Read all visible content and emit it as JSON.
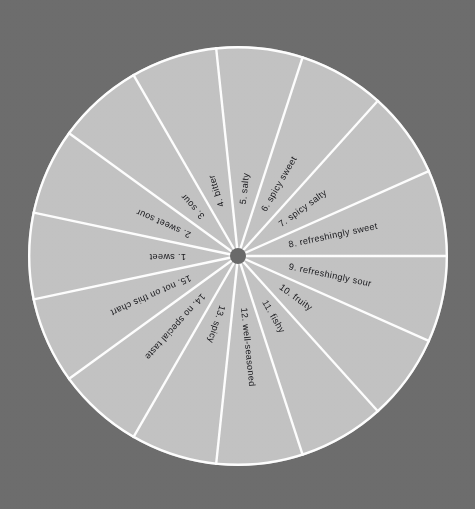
{
  "chart_data": {
    "type": "pie",
    "title": "",
    "subtitle": "",
    "xlabel": "",
    "ylabel": "",
    "legend_position": "none",
    "grid": false,
    "equal_slices": true,
    "slice_count": 15,
    "slice_angle_degrees": 24,
    "start_angle_degrees": 180,
    "direction": "counterclockwise",
    "categories": [
      "1. sweet",
      "2. sweet sour",
      "3. sour",
      "4. bitter",
      "5. salty",
      "6. spicy sweet",
      "7. spicy salty",
      "8. refreshingly sweet",
      "9. refreshingly sour",
      "10. fruity",
      "11. fishy",
      "12. well-seasoned",
      "13. spicy",
      "14. no special taste",
      "15. not on this chart"
    ],
    "values": [
      1,
      1,
      1,
      1,
      1,
      1,
      1,
      1,
      1,
      1,
      1,
      1,
      1,
      1,
      1
    ],
    "annotations": []
  },
  "colors": {
    "background": "#6d6d6d",
    "slice_fill": "#c2c2c2",
    "slice_divider": "#fdfdfd",
    "hub": "#6a6a6a",
    "label_text": "#17171b"
  },
  "wheel": {
    "center_x": 238,
    "center_y": 256,
    "radius": 210,
    "hub_radius": 8,
    "label_inner_radius": 52,
    "divider_width": 2.4
  },
  "slices": [
    {
      "index": 1,
      "label": "1. sweet",
      "mid_angle": 180
    },
    {
      "index": 2,
      "label": "2. sweet sour",
      "mid_angle": 156
    },
    {
      "index": 3,
      "label": "3. sour",
      "mid_angle": 132
    },
    {
      "index": 4,
      "label": "4. bitter",
      "mid_angle": 108
    },
    {
      "index": 5,
      "label": "5. salty",
      "mid_angle": 84
    },
    {
      "index": 6,
      "label": "6. spicy sweet",
      "mid_angle": 60
    },
    {
      "index": 7,
      "label": "7. spicy salty",
      "mid_angle": 36
    },
    {
      "index": 8,
      "label": "8. refreshingly sweet",
      "mid_angle": 12
    },
    {
      "index": 9,
      "label": "9. refreshingly sour",
      "mid_angle": 348
    },
    {
      "index": 10,
      "label": "10. fruity",
      "mid_angle": 324
    },
    {
      "index": 11,
      "label": "11. fishy",
      "mid_angle": 300
    },
    {
      "index": 12,
      "label": "12. well-seasoned",
      "mid_angle": 276
    },
    {
      "index": 13,
      "label": "13. spicy",
      "mid_angle": 252
    },
    {
      "index": 14,
      "label": "14. no special taste",
      "mid_angle": 228
    },
    {
      "index": 15,
      "label": "15. not on this chart",
      "mid_angle": 204
    }
  ]
}
